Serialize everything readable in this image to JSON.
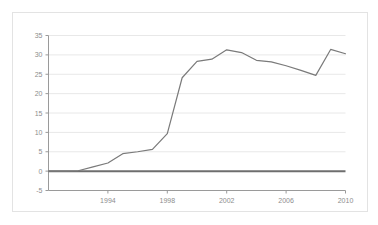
{
  "chart_data": {
    "type": "line",
    "title": "",
    "subtitle": "",
    "xlabel": "",
    "ylabel": "",
    "xlim": [
      1990,
      2010
    ],
    "ylim": [
      -5,
      35
    ],
    "yticks": [
      -5,
      0,
      5,
      10,
      15,
      20,
      25,
      30,
      35
    ],
    "ytick_labels": [
      "-5",
      "0",
      "5",
      "10",
      "15",
      "20",
      "25",
      "30",
      "35"
    ],
    "xticks": [
      1994,
      1998,
      2002,
      2006,
      2010
    ],
    "xtick_labels": [
      "1994",
      "1998",
      "2002",
      "2006",
      "2010"
    ],
    "grid": true,
    "grid_axis": "y",
    "legend": false,
    "legend_position": "none",
    "zero_line": true,
    "annotations": [],
    "series": [
      {
        "name": "series-1",
        "color": "#7a7a7a",
        "x": [
          1990,
          1991,
          1992,
          1993,
          1994,
          1995,
          1996,
          1997,
          1998,
          1999,
          2000,
          2001,
          2002,
          2003,
          2004,
          2005,
          2006,
          2007,
          2008,
          2009,
          2010
        ],
        "values": [
          0.0,
          0.0,
          0.1,
          1.1,
          2.1,
          4.5,
          5.0,
          5.6,
          9.7,
          24.1,
          28.3,
          28.9,
          31.3,
          30.6,
          28.6,
          28.2,
          27.2,
          26.0,
          24.7,
          31.4,
          30.3
        ]
      }
    ],
    "colors": {
      "line": "#7a7a7a",
      "grid": "#e8e8e8",
      "axis": "#9a9a9a",
      "zero_line": "#6e6e6e",
      "tick_text": "#8d8d8d",
      "frame": "#e3e3e3",
      "background": "#ffffff"
    }
  }
}
